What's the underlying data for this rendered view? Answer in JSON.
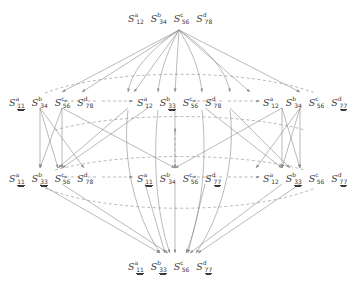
{
  "diagram": {
    "type": "hasse-diagram",
    "background": "#ffffff",
    "edge_color": "#8c8c8c",
    "text_color": "#3b3b3b",
    "levels": 4,
    "symbol_base": "S",
    "superscripts": [
      "a",
      "b",
      "c",
      "d"
    ],
    "node_groups": [
      {
        "id": "top",
        "level": 0,
        "x": 128,
        "y": 13,
        "nodes": [
          {
            "base": "S",
            "sup": "a",
            "sub": "12",
            "underline": "none"
          },
          {
            "base": "S",
            "sup": "b",
            "sub": "34",
            "underline": "none"
          },
          {
            "base": "S",
            "sup": "c",
            "sub": "56",
            "underline": "none"
          },
          {
            "base": "S",
            "sup": "d",
            "sub": "78",
            "underline": "none"
          }
        ]
      },
      {
        "id": "l1-left",
        "level": 1,
        "x": 9,
        "y": 97,
        "nodes": [
          {
            "base": "S",
            "sup": "a",
            "sub": "11",
            "underline": "double"
          },
          {
            "base": "S",
            "sup": "b",
            "sub": "34",
            "underline": "none"
          },
          {
            "base": "S",
            "sup": "c",
            "sub": "56",
            "underline": "none"
          },
          {
            "base": "S",
            "sup": "d",
            "sub": "78",
            "underline": "none"
          }
        ]
      },
      {
        "id": "l1-center",
        "level": 1,
        "x": 137,
        "y": 97,
        "nodes": [
          {
            "base": "S",
            "sup": "a",
            "sub": "12",
            "underline": "none"
          },
          {
            "base": "S",
            "sup": "b",
            "sub": "33",
            "underline": "double"
          },
          {
            "base": "S",
            "sup": "c",
            "sub": "56",
            "underline": "none"
          },
          {
            "base": "S",
            "sup": "d",
            "sub": "78",
            "underline": "none"
          }
        ]
      },
      {
        "id": "l1-right",
        "level": 1,
        "x": 263,
        "y": 97,
        "nodes": [
          {
            "base": "S",
            "sup": "a",
            "sub": "12",
            "underline": "none"
          },
          {
            "base": "S",
            "sup": "b",
            "sub": "34",
            "underline": "none"
          },
          {
            "base": "S",
            "sup": "c",
            "sub": "56",
            "underline": "none"
          },
          {
            "base": "S",
            "sup": "d",
            "sub": "77",
            "underline": "double"
          }
        ]
      },
      {
        "id": "l2-left",
        "level": 2,
        "x": 9,
        "y": 173,
        "nodes": [
          {
            "base": "S",
            "sup": "a",
            "sub": "11",
            "underline": "double"
          },
          {
            "base": "S",
            "sup": "b",
            "sub": "33",
            "underline": "double"
          },
          {
            "base": "S",
            "sup": "c",
            "sub": "56",
            "underline": "none"
          },
          {
            "base": "S",
            "sup": "d",
            "sub": "78",
            "underline": "none"
          }
        ]
      },
      {
        "id": "l2-center",
        "level": 2,
        "x": 137,
        "y": 173,
        "nodes": [
          {
            "base": "S",
            "sup": "a",
            "sub": "11",
            "underline": "double"
          },
          {
            "base": "S",
            "sup": "b",
            "sub": "34",
            "underline": "none"
          },
          {
            "base": "S",
            "sup": "c",
            "sub": "56",
            "underline": "none"
          },
          {
            "base": "S",
            "sup": "d",
            "sub": "77",
            "underline": "double"
          }
        ]
      },
      {
        "id": "l2-right",
        "level": 2,
        "x": 263,
        "y": 173,
        "nodes": [
          {
            "base": "S",
            "sup": "a",
            "sub": "12",
            "underline": "none"
          },
          {
            "base": "S",
            "sup": "b",
            "sub": "33",
            "underline": "double"
          },
          {
            "base": "S",
            "sup": "c",
            "sub": "56",
            "underline": "none"
          },
          {
            "base": "S",
            "sup": "d",
            "sub": "77",
            "underline": "double"
          }
        ]
      },
      {
        "id": "bottom",
        "level": 3,
        "x": 128,
        "y": 261,
        "nodes": [
          {
            "base": "S",
            "sup": "a",
            "sub": "11",
            "underline": "double"
          },
          {
            "base": "S",
            "sup": "b",
            "sub": "33",
            "underline": "double"
          },
          {
            "base": "S",
            "sup": "c",
            "sub": "56",
            "underline": "none"
          },
          {
            "base": "S",
            "sup": "d",
            "sub": "77",
            "underline": "double"
          }
        ]
      }
    ]
  }
}
